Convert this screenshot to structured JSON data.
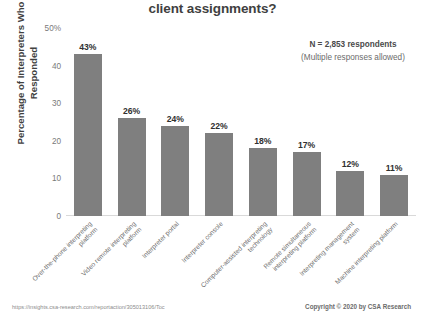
{
  "chart_data": {
    "type": "bar",
    "title": "client assignments?",
    "xlabel": "",
    "ylabel": "Percentage of Interpreters Who Responded",
    "ylim": [
      0,
      50
    ],
    "yticks": [
      0,
      10,
      20,
      30,
      40,
      50
    ],
    "ytick_labels": [
      "0",
      "10",
      "20",
      "30",
      "40",
      "50%"
    ],
    "grid": false,
    "legend": null,
    "categories": [
      "Over-the-phone interpreting platform",
      "Video remote interpreting platform",
      "Interpreter portal",
      "Interpreter console",
      "Computer-assisted interpreting technology",
      "Remote simultaneous interpreting platform",
      "Interpreting management system",
      "Machine interpreting platform"
    ],
    "values": [
      43,
      26,
      24,
      22,
      18,
      17,
      12,
      11
    ],
    "value_labels": [
      "43%",
      "26%",
      "24%",
      "22%",
      "18%",
      "17%",
      "12%",
      "11%"
    ],
    "bar_color": "#7f7f7f",
    "annotations": [
      "N = 2,853 respondents",
      "(Multiple responses allowed)"
    ]
  },
  "annotation": {
    "line1": "N = 2,853 respondents",
    "line2": "(Multiple responses allowed)"
  },
  "footer": {
    "url": "https://insights.csa-research.com/reportaction/305013106/Toc",
    "copyright": "Copyright © 2020 by CSA Research"
  }
}
